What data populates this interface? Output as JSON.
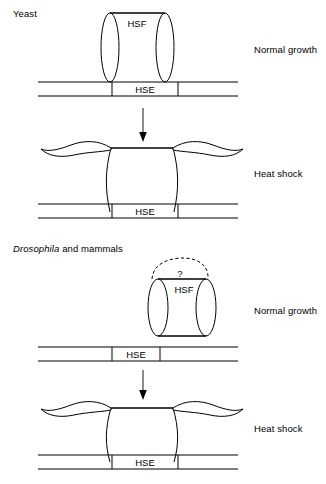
{
  "figure": {
    "title_alt": "HSF binding to HSE under normal growth and heat shock",
    "background_color": "#ffffff",
    "line_color": "#000000"
  },
  "sections": [
    {
      "id": "yeast",
      "species_label": "Yeast",
      "species_label_italic_part": "",
      "panels": [
        {
          "id": "yeast-normal",
          "condition_label": "Normal growth",
          "protein_label": "HSF",
          "dna_element_label": "HSE",
          "protein_state": "bound-compact-cylinder",
          "has_question_bubble": false,
          "question_mark": ""
        },
        {
          "id": "yeast-heatshock",
          "condition_label": "Heat shock",
          "protein_label": "",
          "dna_element_label": "HSE",
          "protein_state": "bound-activated-wavy",
          "has_question_bubble": false,
          "question_mark": ""
        }
      ],
      "transition_arrow": "down-arrow"
    },
    {
      "id": "drosophila-mammals",
      "species_label_italic_part": "Drosophila",
      "species_label_rest": " and mammals",
      "panels": [
        {
          "id": "fly-normal",
          "condition_label": "Normal growth",
          "protein_label": "HSF",
          "dna_element_label": "HSE",
          "protein_state": "unbound-cylinder-above-dna",
          "has_question_bubble": true,
          "question_mark": "?"
        },
        {
          "id": "fly-heatshock",
          "condition_label": "Heat shock",
          "protein_label": "",
          "dna_element_label": "HSE",
          "protein_state": "bound-activated-wavy",
          "has_question_bubble": false,
          "question_mark": ""
        }
      ],
      "transition_arrow": "down-arrow"
    }
  ],
  "text_tokens": {
    "hsf": "HSF",
    "hse": "HSE",
    "normal_growth": "Normal growth",
    "heat_shock": "Heat shock",
    "yeast": "Yeast",
    "drosophila": "Drosophila",
    "and_mammals": " and mammals",
    "question": "?"
  }
}
